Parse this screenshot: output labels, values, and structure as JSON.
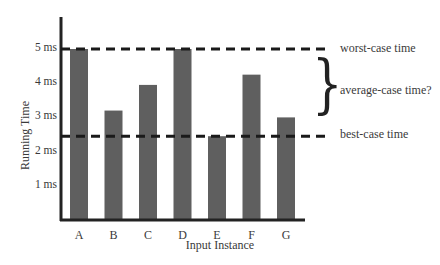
{
  "chart_data": {
    "type": "bar",
    "title": "",
    "xlabel": "Input Instance",
    "ylabel": "Running Time",
    "categories": [
      "A",
      "B",
      "C",
      "D",
      "E",
      "F",
      "G"
    ],
    "values": [
      5.0,
      3.2,
      3.95,
      5.0,
      2.45,
      4.25,
      3.0
    ],
    "unit": "ms",
    "yticks": [
      1,
      2,
      3,
      4,
      5
    ],
    "ytick_labels": [
      "1 ms",
      "2 ms",
      "3 ms",
      "4 ms",
      "5 ms"
    ],
    "ylim": [
      0,
      5.8
    ],
    "grid": false,
    "bar_color": "#5f5f5f",
    "reference_lines": [
      {
        "name": "worst-case",
        "value": 5.0,
        "label": "worst-case time",
        "style": "dashed"
      },
      {
        "name": "best-case",
        "value": 2.45,
        "label": "best-case time",
        "style": "dashed"
      }
    ],
    "annotations": [
      {
        "type": "brace",
        "between": [
          "best-case",
          "worst-case"
        ],
        "label": "average-case time?"
      }
    ]
  }
}
